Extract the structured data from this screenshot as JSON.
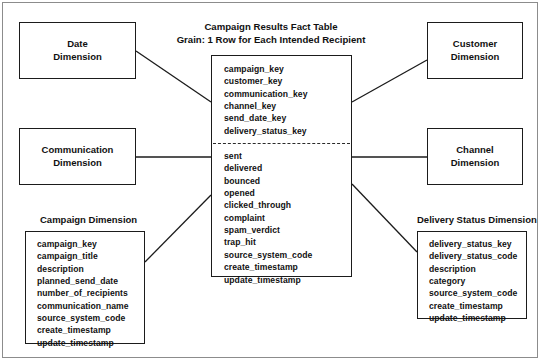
{
  "diagram": {
    "title_line1": "Campaign Results Fact Table",
    "title_line2": "Grain: 1 Row for Each Intended Recipient",
    "line_color": "#1b1b1b",
    "frame_color": "#8c8c8c",
    "background": "#ffffff"
  },
  "fact_table": {
    "keys": [
      "campaign_key",
      "customer_key",
      "communication_key",
      "channel_key",
      "send_date_key",
      "delivery_status_key"
    ],
    "measures": [
      "sent",
      "delivered",
      "bounced",
      "opened",
      "clicked_through",
      "complaint",
      "spam_verdict",
      "trap_hit",
      "source_system_code",
      "create_timestamp",
      "update_timestamp"
    ]
  },
  "dimensions": {
    "date": {
      "line1": "Date",
      "line2": "Dimension"
    },
    "communication": {
      "line1": "Communication",
      "line2": "Dimension"
    },
    "customer": {
      "line1": "Customer",
      "line2": "Dimension"
    },
    "channel": {
      "line1": "Channel",
      "line2": "Dimension"
    },
    "campaign": {
      "caption": "Campaign Dimension",
      "fields": [
        "campaign_key",
        "campaign_title",
        "description",
        "planned_send_date",
        "number_of_recipients",
        "communication_name",
        "source_system_code",
        "create_timestamp",
        "update_timestamp"
      ]
    },
    "delivery_status": {
      "caption": "Delivery Status Dimension",
      "fields": [
        "delivery_status_key",
        "delivery_status_code",
        "description",
        "category",
        "source_system_code",
        "create_timestamp",
        "update_timestamp"
      ]
    }
  }
}
